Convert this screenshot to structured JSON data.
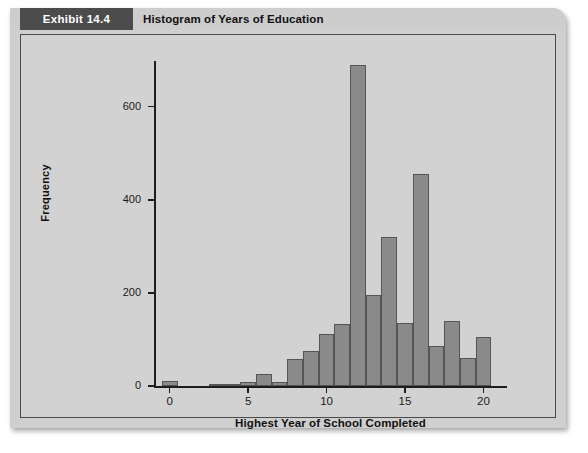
{
  "exhibit": {
    "tag": "Exhibit 14.4",
    "title": "Histogram of Years of Education"
  },
  "chart_data": {
    "type": "bar",
    "title": "Histogram of Years of Education",
    "xlabel": "Highest Year of School Completed",
    "ylabel": "Frequency",
    "xlim": [
      -1,
      21.5
    ],
    "ylim": [
      0,
      700
    ],
    "grid": false,
    "legend": null,
    "bin_width": 1,
    "xticks": [
      0,
      5,
      10,
      15,
      20
    ],
    "yticks": [
      0,
      200,
      400,
      600
    ],
    "categories": [
      0,
      1,
      2,
      3,
      4,
      5,
      6,
      7,
      8,
      9,
      10,
      11,
      12,
      13,
      14,
      15,
      16,
      17,
      18,
      19,
      20
    ],
    "values": [
      10,
      0,
      0,
      4,
      4,
      8,
      26,
      8,
      58,
      75,
      112,
      133,
      690,
      195,
      320,
      135,
      455,
      85,
      140,
      60,
      105
    ]
  }
}
